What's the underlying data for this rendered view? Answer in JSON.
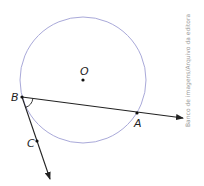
{
  "diagram": {
    "circle": {
      "cx": 83,
      "cy": 80,
      "r": 63,
      "stroke": "#a9a9d9"
    },
    "points": [
      {
        "name": "O",
        "x": 83,
        "y": 80,
        "label_x": 80,
        "label_y": 74
      },
      {
        "name": "B",
        "x": 22,
        "y": 97,
        "label_x": 10,
        "label_y": 101
      },
      {
        "name": "A",
        "x": 137,
        "y": 113,
        "label_x": 136,
        "label_y": 126
      },
      {
        "name": "C",
        "x": 37,
        "y": 141,
        "label_x": 27,
        "label_y": 146
      }
    ],
    "rays": [
      {
        "name": "ray-BA",
        "from": "B",
        "to_x": 183,
        "to_y": 118
      },
      {
        "name": "ray-BC",
        "from": "B",
        "to_x": 50,
        "to_y": 179
      }
    ],
    "angle_marker": {
      "vertex": "B",
      "between": [
        "A",
        "C"
      ]
    },
    "credit": "Banco de imagens/Arquivo da editora",
    "line_color": "#222222"
  }
}
